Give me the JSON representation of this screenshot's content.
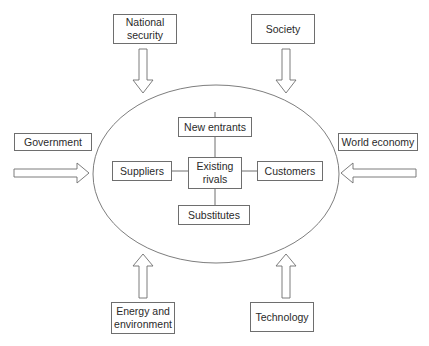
{
  "diagram": {
    "type": "environment-forces-diagram",
    "center": {
      "label": "Existing\nrivals"
    },
    "inner_forces": [
      {
        "id": "new-entrants",
        "label": "New entrants",
        "position": "top"
      },
      {
        "id": "suppliers",
        "label": "Suppliers",
        "position": "left"
      },
      {
        "id": "customers",
        "label": "Customers",
        "position": "right"
      },
      {
        "id": "substitutes",
        "label": "Substitutes",
        "position": "bottom"
      }
    ],
    "outer_forces": [
      {
        "id": "national-security",
        "label": "National\nsecurity",
        "position": "top-left",
        "arrow": "down"
      },
      {
        "id": "society",
        "label": "Society",
        "position": "top-right",
        "arrow": "down"
      },
      {
        "id": "government",
        "label": "Government",
        "position": "left",
        "arrow": "right"
      },
      {
        "id": "world-economy",
        "label": "World economy",
        "position": "right",
        "arrow": "left"
      },
      {
        "id": "energy-environment",
        "label": "Energy and\nenvironment",
        "position": "bottom-left",
        "arrow": "up"
      },
      {
        "id": "technology",
        "label": "Technology",
        "position": "bottom-right",
        "arrow": "up"
      }
    ],
    "colors": {
      "stroke": "#6e6e6e",
      "text": "#2a2a2a",
      "background": "#ffffff"
    }
  }
}
